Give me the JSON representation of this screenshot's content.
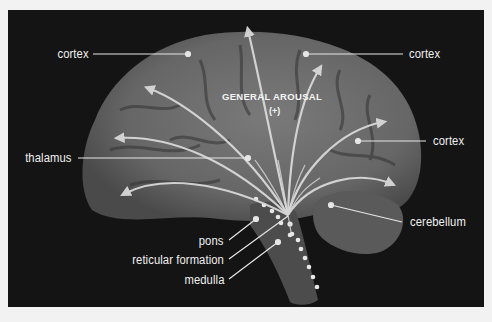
{
  "diagram": {
    "title": "GENERAL AROUSAL",
    "sign": "(+)",
    "labels": {
      "cortex_top_left": "cortex",
      "cortex_top_right": "cortex",
      "cortex_right": "cortex",
      "thalamus": "thalamus",
      "cerebellum": "cerebellum",
      "pons": "pons",
      "reticular_formation": "reticular formation",
      "medulla": "medulla"
    },
    "colors": {
      "background": "#f2f2f2",
      "panel": "#141414",
      "brain": "#6e6e6e",
      "arrows": "#d8d8d8",
      "labels": "#f0f0f0"
    }
  }
}
